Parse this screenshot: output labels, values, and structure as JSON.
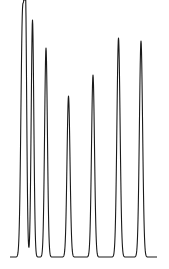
{
  "chart_data": {
    "type": "line",
    "title": "",
    "xlabel": "",
    "ylabel": "",
    "grid": false,
    "legend": null,
    "baseline_y_px": 257,
    "x_range_px": [
      10,
      157
    ],
    "peaks": [
      {
        "id": 1,
        "x_px": 22.5,
        "top_y_px": 19,
        "half_width_px": 1.6,
        "relative_height": 1.0
      },
      {
        "id": 2,
        "x_px": 25.5,
        "top_y_px": 19,
        "half_width_px": 1.2,
        "relative_height": 1.0
      },
      {
        "id": 3,
        "x_px": 32.5,
        "top_y_px": 20,
        "half_width_px": 1.3,
        "relative_height": 0.99
      },
      {
        "id": 4,
        "x_px": 46,
        "top_y_px": 48,
        "half_width_px": 1.4,
        "relative_height": 0.88
      },
      {
        "id": 5,
        "x_px": 68.5,
        "top_y_px": 96,
        "half_width_px": 1.5,
        "relative_height": 0.68
      },
      {
        "id": 6,
        "x_px": 93,
        "top_y_px": 75,
        "half_width_px": 1.5,
        "relative_height": 0.77
      },
      {
        "id": 7,
        "x_px": 118.5,
        "top_y_px": 38,
        "half_width_px": 1.6,
        "relative_height": 0.92
      },
      {
        "id": 8,
        "x_px": 141,
        "top_y_px": 41,
        "half_width_px": 1.6,
        "relative_height": 0.91
      }
    ],
    "line_color": "#1a1a1a",
    "background_color": "#ffffff"
  }
}
